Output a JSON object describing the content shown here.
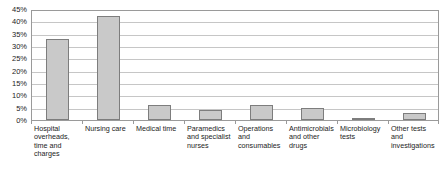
{
  "chart_data": {
    "type": "bar",
    "title": "",
    "xlabel": "",
    "ylabel": "",
    "ylim": [
      0,
      45
    ],
    "grid": true,
    "legend": "none",
    "orientation": "vertical",
    "yticks": [
      "0%",
      "5%",
      "10%",
      "15%",
      "20%",
      "25%",
      "30%",
      "35%",
      "40%",
      "45%"
    ],
    "ytick_values": [
      0,
      5,
      10,
      15,
      20,
      25,
      30,
      35,
      40,
      45
    ],
    "categories": [
      "Hospital overheads, time and charges",
      "Nursing care",
      "Medical time",
      "Paramedics and specialist nurses",
      "Operations and consumables",
      "Antimicrobials and other drugs",
      "Microbiology tests",
      "Other tests and investigations"
    ],
    "values": [
      33,
      42,
      6,
      4,
      6,
      5,
      1,
      3
    ],
    "value_labels": [
      "33%",
      "42%",
      "6%",
      "4%",
      "6%",
      "5%",
      "1%",
      "3%"
    ],
    "series": [
      {
        "name": "Share of cost",
        "values": [
          33,
          42,
          6,
          4,
          6,
          5,
          1,
          3
        ]
      }
    ]
  },
  "style": {
    "bar_fill": "#c9c9c9",
    "bar_border": "#7d7d7d",
    "gridline_color": "#c6c6c6",
    "plot_border": "#9a9a9a",
    "text_color": "#232323",
    "background": "#ffffff"
  },
  "cropped_title_fragment": ""
}
